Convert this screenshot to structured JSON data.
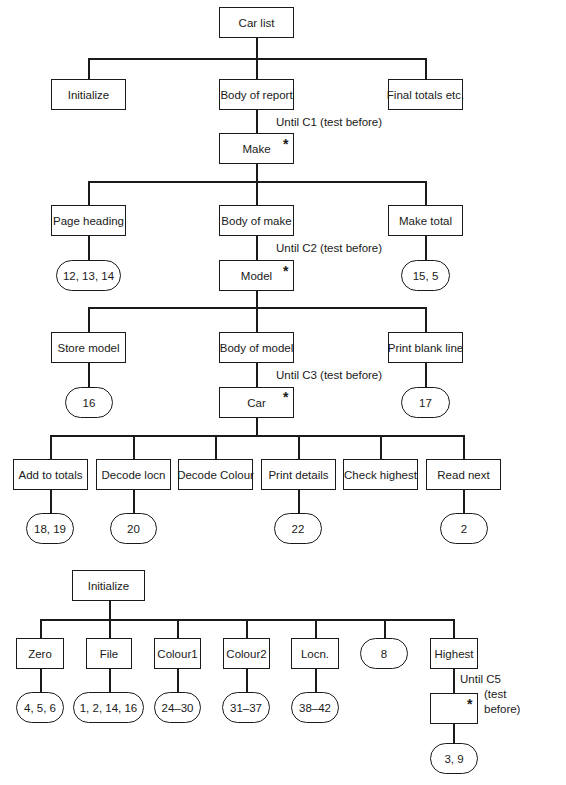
{
  "diagram1": {
    "root": "Car list",
    "level1": [
      "Initialize",
      "Body of report",
      "Final totals etc."
    ],
    "c1_note": "Until C1 (test before)",
    "make": "Make",
    "level2": [
      "Page heading",
      "Body of make",
      "Make total"
    ],
    "c2_note": "Until C2 (test  before)",
    "level2_ovals": [
      "12, 13, 14",
      "15, 5"
    ],
    "model": "Model",
    "level3": [
      "Store model",
      "Body of model",
      "Print blank line"
    ],
    "c3_note": "Until C3 (test before)",
    "level3_ovals": [
      "16",
      "17"
    ],
    "car": "Car",
    "level4": [
      "Add to totals",
      "Decode locn",
      "Decode Colour",
      "Print details",
      "Check highest",
      "Read next"
    ],
    "level4_ovals": [
      "18, 19",
      "20",
      "22",
      "2"
    ],
    "iteration_marker": "*"
  },
  "diagram2": {
    "root": "Initialize",
    "children": [
      "Zero",
      "File",
      "Colour1",
      "Colour2",
      "Locn.",
      "8",
      "Highest"
    ],
    "ovals": [
      "4, 5, 6",
      "1, 2, 14, 16",
      "24–30",
      "31–37",
      "38–42"
    ],
    "c5_note_line1": "Until C5",
    "c5_note_line2": "(test",
    "c5_note_line3": "before)",
    "highest_leaf": "3, 9",
    "iteration_marker": "*"
  }
}
